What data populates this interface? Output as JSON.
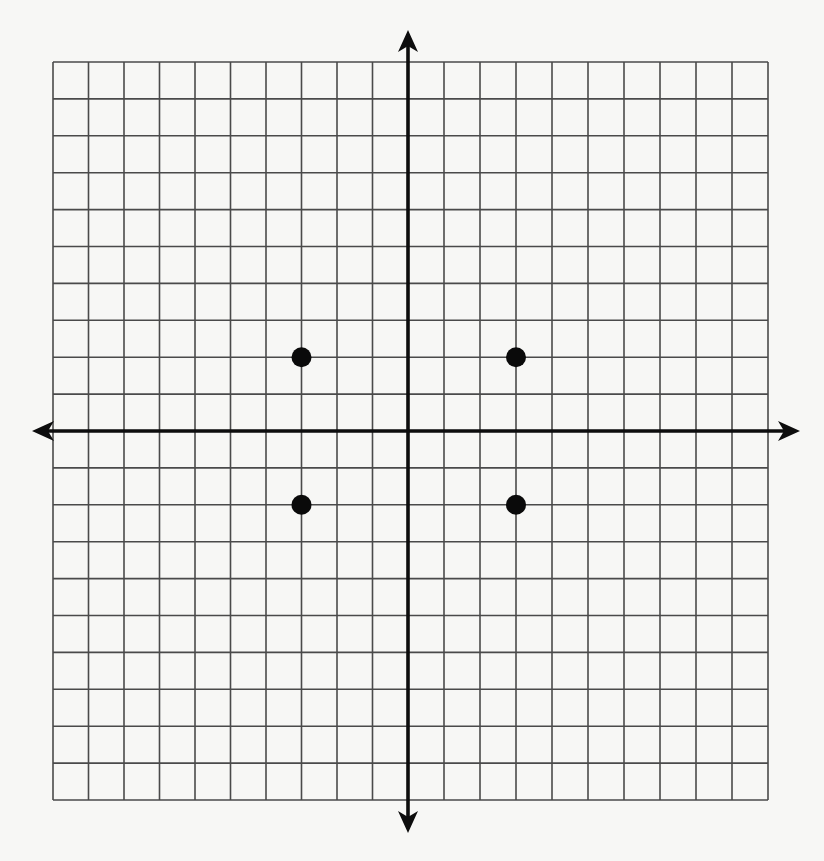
{
  "colors": {
    "background": "#f7f7f5",
    "grid": "#4a4a4a",
    "axis": "#0d0d0d",
    "point": "#0a0a0a"
  },
  "grid": {
    "x_min": -10,
    "x_max": 10,
    "y_min": -10,
    "y_max": 10,
    "step": 1,
    "px_left": 53,
    "px_right": 768,
    "px_top": 62,
    "px_bottom": 800,
    "origin_px": [
      408,
      431
    ]
  },
  "axes": {
    "x_arrow_left": 32,
    "x_arrow_right": 800,
    "y_arrow_top": 30,
    "y_arrow_bottom": 833,
    "x_label": "",
    "y_label": ""
  },
  "points": [
    {
      "label": "",
      "x": -3,
      "y": 2
    },
    {
      "label": "",
      "x": 3,
      "y": 2
    },
    {
      "label": "",
      "x": -3,
      "y": -2
    },
    {
      "label": "",
      "x": 3,
      "y": -2
    }
  ]
}
